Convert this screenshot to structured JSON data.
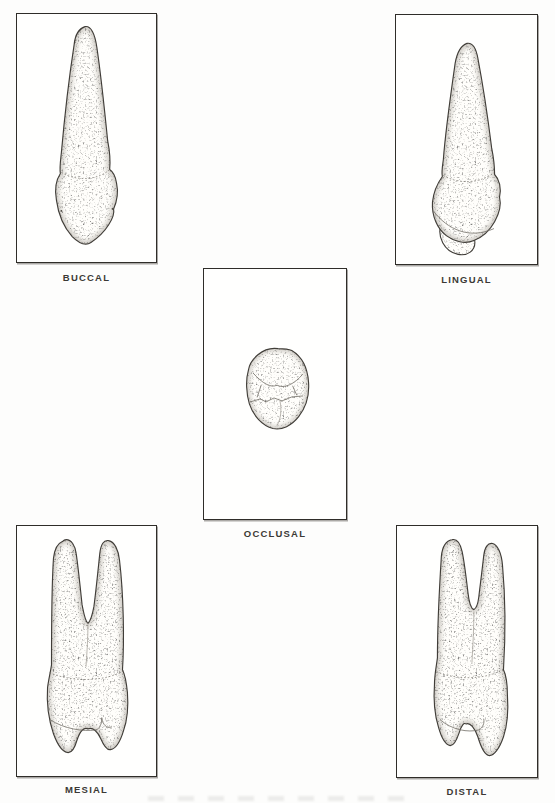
{
  "figures": {
    "buccal": {
      "label": "BUCCAL"
    },
    "lingual": {
      "label": "LINGUAL"
    },
    "occlusal": {
      "label": "OCCLUSAL"
    },
    "mesial": {
      "label": "MESIAL"
    },
    "distal": {
      "label": "DISTAL"
    }
  },
  "colors": {
    "paper": "#fdfdfc",
    "panel-border": "#2f2d29",
    "label": "#3b3935",
    "ink": "#3f3c36"
  }
}
